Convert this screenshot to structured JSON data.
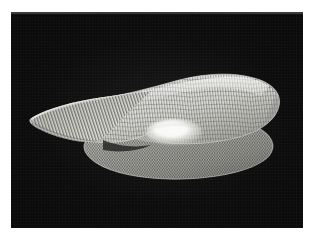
{
  "figure": {
    "kind": "3d-mesh-surface-plot",
    "medium": "halftone-scan",
    "background_color": "#0a0a0a",
    "page_color": "#ffffff",
    "surface_color_light": "#f2f2f0",
    "surface_color_mid": "#b8b8b4",
    "surface_color_dark": "#6e6e6c",
    "mesh_line_color": "#4a4a48",
    "plate": {
      "x": 11,
      "y": 12,
      "width": 292,
      "height": 216
    },
    "title": "",
    "caption": "",
    "axis_labels": [],
    "tick_labels": [],
    "legend": []
  },
  "chart_data": {
    "type": "surface",
    "title": "",
    "subtitle": "",
    "xlabel": "",
    "ylabel": "",
    "zlabel": "",
    "grid": true,
    "legend_position": "none",
    "view": {
      "azimuth_deg": -37,
      "elevation_deg": 14,
      "projection": "orthographic"
    },
    "xlim": [
      -1,
      1
    ],
    "ylim": [
      -1,
      1
    ],
    "zlim": [
      0,
      1
    ],
    "surfaces": [
      {
        "name": "upper-surface",
        "description": "dome with central saddle dip, elongated along x, lit from upper-left",
        "mesh_nx": 48,
        "mesh_ny": 34,
        "peak_height": 1.0,
        "saddle_height": 0.52,
        "edge_height": 0.18,
        "peak_xy": [
          0.35,
          0.0
        ],
        "saddle_xy": [
          0.0,
          0.0
        ]
      },
      {
        "name": "lower-surface",
        "description": "flatter elliptical base sheet with shallow central rise",
        "mesh_nx": 46,
        "mesh_ny": 30,
        "peak_height": 0.22,
        "edge_height": 0.0,
        "peak_xy": [
          0.05,
          0.0
        ]
      }
    ],
    "annotations": []
  }
}
